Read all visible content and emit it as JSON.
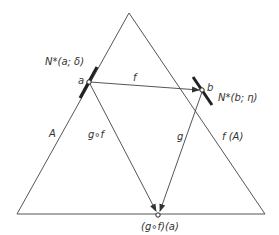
{
  "diagram": {
    "colors": {
      "line": "#555555",
      "text": "#333333",
      "background": "#ffffff"
    },
    "triangles": [
      {
        "name": "A",
        "label": "A",
        "vertices": [
          [
            129,
            13
          ],
          [
            17,
            214
          ],
          [
            160,
            214
          ]
        ]
      },
      {
        "name": "f(A)",
        "label": "f (A)",
        "vertices": [
          [
            129,
            13
          ],
          [
            160,
            214
          ],
          [
            265,
            214
          ]
        ]
      }
    ],
    "points": {
      "a": {
        "label": "a",
        "x": 89,
        "y": 82
      },
      "b": {
        "label": "b",
        "x": 202,
        "y": 90
      },
      "gfa": {
        "label": "(g∘f)(a)",
        "x": 158,
        "y": 216
      }
    },
    "neighborhoods": {
      "a": {
        "label": "N*(a; δ)"
      },
      "b": {
        "label": "N*(b; η)"
      }
    },
    "arrows": {
      "f": {
        "label": "f",
        "from": "a",
        "to": "b"
      },
      "g": {
        "label": "g",
        "from": "b",
        "to": "gfa"
      },
      "gf": {
        "label": "g∘f",
        "from": "a",
        "to": "gfa"
      }
    }
  }
}
